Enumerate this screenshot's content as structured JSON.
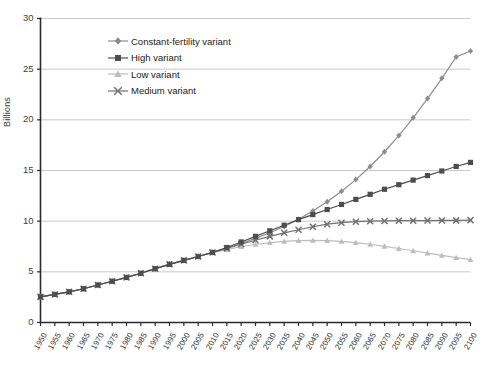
{
  "chart_data": {
    "type": "line",
    "title": "",
    "xlabel": "",
    "ylabel": "Billions",
    "xlim": [
      1950,
      2100
    ],
    "ylim": [
      0,
      30
    ],
    "ytick_step": 5,
    "grid": true,
    "legend_position": "top-left-inside",
    "x": [
      1950,
      1955,
      1960,
      1965,
      1970,
      1975,
      1980,
      1985,
      1990,
      1995,
      2000,
      2005,
      2010,
      2015,
      2020,
      2025,
      2030,
      2035,
      2040,
      2045,
      2050,
      2055,
      2060,
      2065,
      2070,
      2075,
      2080,
      2085,
      2090,
      2095,
      2100
    ],
    "xtick_labels": [
      "1950",
      "1955",
      "1960",
      "1965",
      "1970",
      "1975",
      "1980",
      "1985",
      "1990",
      "1995",
      "2000",
      "2005",
      "2010",
      "2015",
      "2020",
      "2025",
      "2030",
      "2035",
      "2040",
      "2045",
      "2050",
      "2055",
      "2060",
      "2065",
      "2070",
      "2075",
      "2080",
      "2085",
      "2090",
      "2095",
      "2100"
    ],
    "ytick_labels": [
      "0",
      "5",
      "10",
      "15",
      "20",
      "25",
      "30"
    ],
    "ytick_values": [
      0,
      5,
      10,
      15,
      20,
      25,
      30
    ],
    "series": [
      {
        "name": "Constant-fertility variant",
        "marker": "diamond",
        "color": "#8c8c8c",
        "values": [
          2.53,
          2.77,
          3.03,
          3.33,
          3.7,
          4.07,
          4.45,
          4.86,
          5.31,
          5.74,
          6.13,
          6.51,
          6.92,
          7.35,
          7.8,
          8.3,
          8.85,
          9.47,
          10.18,
          11.0,
          11.92,
          12.95,
          14.1,
          15.4,
          16.85,
          18.45,
          20.2,
          22.1,
          24.1,
          26.2,
          26.8
        ]
      },
      {
        "name": "High variant",
        "marker": "square",
        "color": "#4d4d4d",
        "values": [
          2.53,
          2.77,
          3.03,
          3.33,
          3.7,
          4.07,
          4.45,
          4.86,
          5.31,
          5.74,
          6.13,
          6.51,
          6.92,
          7.4,
          7.95,
          8.5,
          9.05,
          9.6,
          10.15,
          10.65,
          11.15,
          11.65,
          12.15,
          12.65,
          13.15,
          13.6,
          14.05,
          14.5,
          14.95,
          15.4,
          15.8
        ]
      },
      {
        "name": "Low variant",
        "marker": "triangle",
        "color": "#bdbdbd",
        "values": [
          2.53,
          2.77,
          3.03,
          3.33,
          3.7,
          4.07,
          4.45,
          4.86,
          5.31,
          5.74,
          6.13,
          6.51,
          6.9,
          7.2,
          7.5,
          7.7,
          7.88,
          8.0,
          8.08,
          8.1,
          8.08,
          8.0,
          7.88,
          7.72,
          7.52,
          7.3,
          7.08,
          6.85,
          6.62,
          6.4,
          6.2
        ]
      },
      {
        "name": "Medium variant",
        "marker": "x",
        "color": "#707070",
        "values": [
          2.53,
          2.77,
          3.03,
          3.33,
          3.7,
          4.07,
          4.45,
          4.86,
          5.31,
          5.74,
          6.13,
          6.51,
          6.91,
          7.3,
          7.72,
          8.12,
          8.5,
          8.85,
          9.15,
          9.45,
          9.7,
          9.85,
          9.95,
          10.0,
          10.02,
          10.05,
          10.05,
          10.06,
          10.07,
          10.08,
          10.1
        ]
      }
    ]
  },
  "legend": {
    "items": [
      {
        "label": "Constant-fertility variant"
      },
      {
        "label": "High variant"
      },
      {
        "label": "Low variant"
      },
      {
        "label": "Medium variant"
      }
    ]
  },
  "axis": {
    "y_title": "Billions"
  },
  "colors": {
    "grid": "#c8c8c8",
    "axis": "#2b2b2b",
    "background": "#ffffff"
  }
}
